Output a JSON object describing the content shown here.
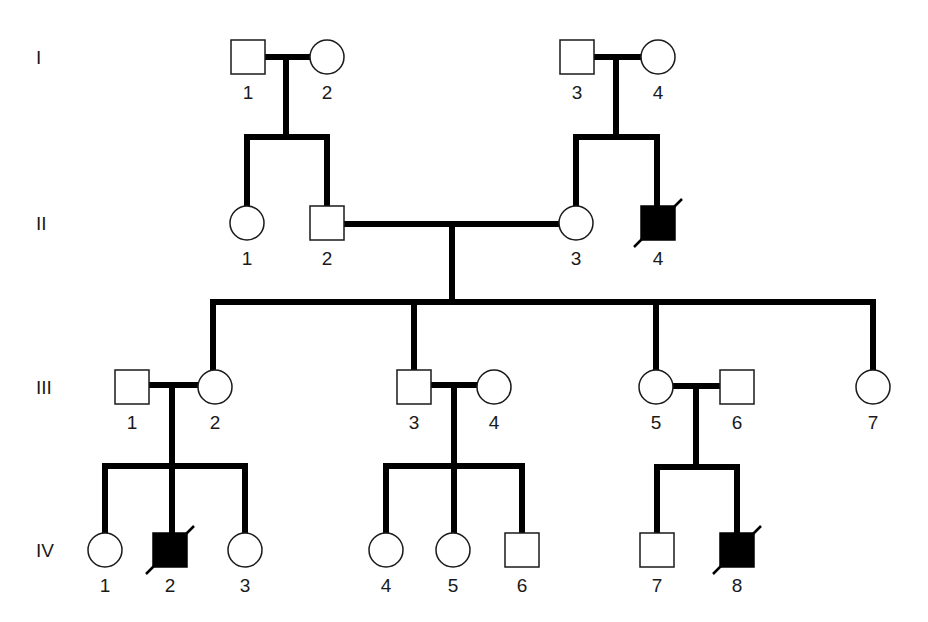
{
  "diagram": {
    "type": "pedigree",
    "colors": {
      "line": "#000000",
      "affected": "#000000",
      "unaffected": "#ffffff"
    },
    "generations": [
      {
        "label": "I",
        "y": 57
      },
      {
        "label": "II",
        "y": 223
      },
      {
        "label": "III",
        "y": 387
      },
      {
        "label": "IV",
        "y": 550
      }
    ],
    "individuals": [
      {
        "gen": 0,
        "id": "1",
        "sex": "male",
        "x": 248,
        "affected": false,
        "deceased": false
      },
      {
        "gen": 0,
        "id": "2",
        "sex": "female",
        "x": 327,
        "affected": false,
        "deceased": false
      },
      {
        "gen": 0,
        "id": "3",
        "sex": "male",
        "x": 577,
        "affected": false,
        "deceased": false
      },
      {
        "gen": 0,
        "id": "4",
        "sex": "female",
        "x": 658,
        "affected": false,
        "deceased": false
      },
      {
        "gen": 1,
        "id": "1",
        "sex": "female",
        "x": 247,
        "affected": false,
        "deceased": false
      },
      {
        "gen": 1,
        "id": "2",
        "sex": "male",
        "x": 327,
        "affected": false,
        "deceased": false
      },
      {
        "gen": 1,
        "id": "3",
        "sex": "female",
        "x": 576,
        "affected": false,
        "deceased": false
      },
      {
        "gen": 1,
        "id": "4",
        "sex": "male",
        "x": 658,
        "affected": true,
        "deceased": true
      },
      {
        "gen": 2,
        "id": "1",
        "sex": "male",
        "x": 132,
        "affected": false,
        "deceased": false
      },
      {
        "gen": 2,
        "id": "2",
        "sex": "female",
        "x": 215,
        "affected": false,
        "deceased": false
      },
      {
        "gen": 2,
        "id": "3",
        "sex": "male",
        "x": 414,
        "affected": false,
        "deceased": false
      },
      {
        "gen": 2,
        "id": "4",
        "sex": "female",
        "x": 494,
        "affected": false,
        "deceased": false
      },
      {
        "gen": 2,
        "id": "5",
        "sex": "female",
        "x": 656,
        "affected": false,
        "deceased": false
      },
      {
        "gen": 2,
        "id": "6",
        "sex": "male",
        "x": 737,
        "affected": false,
        "deceased": false
      },
      {
        "gen": 2,
        "id": "7",
        "sex": "female",
        "x": 873,
        "affected": false,
        "deceased": false
      },
      {
        "gen": 3,
        "id": "1",
        "sex": "female",
        "x": 105,
        "affected": false,
        "deceased": false
      },
      {
        "gen": 3,
        "id": "2",
        "sex": "male",
        "x": 170,
        "affected": true,
        "deceased": true
      },
      {
        "gen": 3,
        "id": "3",
        "sex": "female",
        "x": 245,
        "affected": false,
        "deceased": false
      },
      {
        "gen": 3,
        "id": "4",
        "sex": "female",
        "x": 386,
        "affected": false,
        "deceased": false
      },
      {
        "gen": 3,
        "id": "5",
        "sex": "female",
        "x": 453,
        "affected": false,
        "deceased": false
      },
      {
        "gen": 3,
        "id": "6",
        "sex": "male",
        "x": 522,
        "affected": false,
        "deceased": false
      },
      {
        "gen": 3,
        "id": "7",
        "sex": "male",
        "x": 657,
        "affected": false,
        "deceased": false
      },
      {
        "gen": 3,
        "id": "8",
        "sex": "male",
        "x": 737,
        "affected": true,
        "deceased": true
      }
    ],
    "lines": [
      [
        265,
        57,
        310,
        57
      ],
      [
        286,
        57,
        286,
        137
      ],
      [
        247,
        137,
        327,
        137
      ],
      [
        247,
        137,
        247,
        206
      ],
      [
        327,
        137,
        327,
        206
      ],
      [
        594,
        57,
        641,
        57
      ],
      [
        616,
        57,
        616,
        137
      ],
      [
        576,
        137,
        657,
        137
      ],
      [
        576,
        137,
        576,
        206
      ],
      [
        657,
        137,
        657,
        206
      ],
      [
        344,
        224,
        559,
        224
      ],
      [
        452,
        224,
        452,
        302
      ],
      [
        213,
        302,
        873,
        302
      ],
      [
        213,
        302,
        213,
        370
      ],
      [
        414,
        302,
        414,
        370
      ],
      [
        656,
        302,
        656,
        370
      ],
      [
        873,
        302,
        873,
        370
      ],
      [
        149,
        385,
        198,
        385
      ],
      [
        172,
        385,
        172,
        466
      ],
      [
        105,
        466,
        245,
        466
      ],
      [
        105,
        466,
        105,
        533
      ],
      [
        172,
        466,
        172,
        533
      ],
      [
        245,
        466,
        245,
        533
      ],
      [
        431,
        385,
        477,
        385
      ],
      [
        454,
        385,
        454,
        466
      ],
      [
        386,
        466,
        522,
        466
      ],
      [
        386,
        466,
        386,
        533
      ],
      [
        454,
        466,
        454,
        533
      ],
      [
        522,
        466,
        522,
        533
      ],
      [
        673,
        386,
        720,
        386
      ],
      [
        696,
        386,
        696,
        467
      ],
      [
        657,
        467,
        737,
        467
      ],
      [
        657,
        467,
        657,
        533
      ],
      [
        737,
        467,
        737,
        533
      ]
    ]
  }
}
